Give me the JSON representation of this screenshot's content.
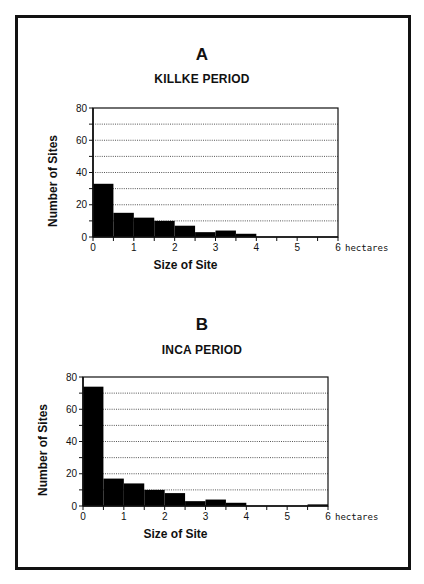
{
  "figure": {
    "panels": [
      {
        "letter": "A",
        "title": "KILLKE PERIOD"
      },
      {
        "letter": "B",
        "title": "INCA PERIOD"
      }
    ],
    "xlabel": "Size of Site",
    "ylabel": "Number of Sites",
    "x_unit": "hectares",
    "bar_color": "#000000",
    "grid_color": "#555555"
  },
  "chart_data": [
    {
      "type": "bar",
      "title": "A — KILLKE PERIOD",
      "xlabel": "Size of Site",
      "x_unit": "hectares",
      "ylabel": "Number of Sites",
      "bin_width": 0.5,
      "bins": [
        "0-0.5",
        "0.5-1",
        "1-1.5",
        "1.5-2",
        "2-2.5",
        "2.5-3",
        "3-3.5",
        "3.5-4",
        "4-4.5",
        "4.5-5",
        "5-5.5",
        "5.5-6"
      ],
      "values": [
        33,
        15,
        12,
        10,
        7,
        3,
        4,
        2,
        0,
        0,
        0,
        0
      ],
      "xlim": [
        0,
        6
      ],
      "xticks": [
        0,
        1,
        2,
        3,
        4,
        5,
        6
      ],
      "ylim": [
        0,
        80
      ],
      "yticks": [
        0,
        20,
        40,
        60,
        80
      ],
      "grid": "horizontal dotted every 10",
      "legend": "none"
    },
    {
      "type": "bar",
      "title": "B — INCA PERIOD",
      "xlabel": "Size of Site",
      "x_unit": "hectares",
      "ylabel": "Number of Sites",
      "bin_width": 0.5,
      "bins": [
        "0-0.5",
        "0.5-1",
        "1-1.5",
        "1.5-2",
        "2-2.5",
        "2.5-3",
        "3-3.5",
        "3.5-4",
        "4-4.5",
        "4.5-5",
        "5-5.5",
        "5.5-6"
      ],
      "values": [
        74,
        17,
        14,
        10,
        8,
        3,
        4,
        2,
        0,
        0,
        0,
        1
      ],
      "xlim": [
        0,
        6
      ],
      "xticks": [
        0,
        1,
        2,
        3,
        4,
        5,
        6
      ],
      "ylim": [
        0,
        80
      ],
      "yticks": [
        0,
        20,
        40,
        60,
        80
      ],
      "grid": "horizontal dotted every 10",
      "legend": "none"
    }
  ]
}
